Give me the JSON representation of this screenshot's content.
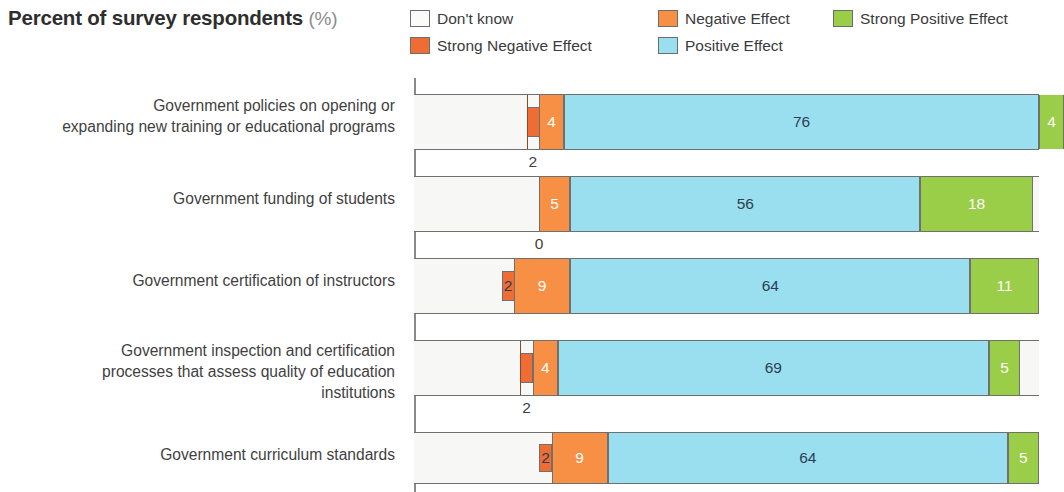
{
  "header": {
    "title": "Percent of survey respondents",
    "unit": "(%)"
  },
  "legend": {
    "items": [
      {
        "label": "Don't know",
        "color": "#fbfbf9",
        "key": "dont_know"
      },
      {
        "label": "Strong Negative Effect",
        "color": "#ef6c35",
        "key": "strong_negative"
      },
      {
        "label": "Negative Effect",
        "color": "#f79044",
        "key": "negative"
      },
      {
        "label": "Positive Effect",
        "color": "#9adff0",
        "key": "positive"
      },
      {
        "label": "Strong Positive Effect",
        "color": "#9acd48",
        "key": "strong_positive"
      }
    ]
  },
  "chart_data": {
    "type": "bar",
    "title": "Percent of survey respondents (%)",
    "xlabel": "",
    "ylabel": "",
    "xlim": [
      0,
      100
    ],
    "grid": false,
    "legend_position": "top-right",
    "stacked": true,
    "orientation": "horizontal",
    "categories": [
      "Government policies on opening or expanding new training or educational programs",
      "Government funding of students",
      "Government certification of instructors",
      "Government inspection and certification processes that assess quality of education institutions",
      "Government curriculum standards"
    ],
    "series": [
      {
        "name": "Don't know",
        "values": [
          18,
          20,
          14,
          17,
          20
        ]
      },
      {
        "name": "Strong Negative Effect",
        "values": [
          2,
          0,
          2,
          2,
          2
        ]
      },
      {
        "name": "Negative Effect",
        "values": [
          4,
          5,
          9,
          4,
          9
        ]
      },
      {
        "name": "Positive Effect",
        "values": [
          76,
          56,
          64,
          69,
          64
        ]
      },
      {
        "name": "Strong Positive Effect",
        "values": [
          4,
          18,
          11,
          5,
          5
        ]
      }
    ]
  },
  "rows": [
    {
      "label_lines": [
        "Government policies on opening or",
        "expanding new training or educational programs"
      ],
      "dont_know": 18,
      "strong_negative": {
        "value": 2,
        "label": "2",
        "placement": "below"
      },
      "negative": {
        "value": 4,
        "label": "4",
        "placement": "inside"
      },
      "positive": {
        "value": 76,
        "label": "76",
        "placement": "inside"
      },
      "strong_positive": {
        "value": 4,
        "label": "4",
        "placement": "inside"
      }
    },
    {
      "label_lines": [
        "Government funding of students"
      ],
      "dont_know": 20,
      "strong_negative": {
        "value": 0,
        "label": "0",
        "placement": "below"
      },
      "negative": {
        "value": 5,
        "label": "5",
        "placement": "inside"
      },
      "positive": {
        "value": 56,
        "label": "56",
        "placement": "inside"
      },
      "strong_positive": {
        "value": 18,
        "label": "18",
        "placement": "inside"
      }
    },
    {
      "label_lines": [
        "Government certification of instructors"
      ],
      "dont_know": 14,
      "strong_negative": {
        "value": 2,
        "label": "2",
        "placement": "inside"
      },
      "negative": {
        "value": 9,
        "label": "9",
        "placement": "inside"
      },
      "positive": {
        "value": 64,
        "label": "64",
        "placement": "inside"
      },
      "strong_positive": {
        "value": 11,
        "label": "11",
        "placement": "inside"
      }
    },
    {
      "label_lines": [
        "Government inspection and certification",
        "processes that assess quality of education",
        "institutions"
      ],
      "dont_know": 17,
      "strong_negative": {
        "value": 2,
        "label": "2",
        "placement": "below"
      },
      "negative": {
        "value": 4,
        "label": "4",
        "placement": "inside"
      },
      "positive": {
        "value": 69,
        "label": "69",
        "placement": "inside"
      },
      "strong_positive": {
        "value": 5,
        "label": "5",
        "placement": "inside"
      }
    },
    {
      "label_lines": [
        "Government curriculum standards"
      ],
      "dont_know": 20,
      "strong_negative": {
        "value": 2,
        "label": "2",
        "placement": "inside"
      },
      "negative": {
        "value": 9,
        "label": "9",
        "placement": "inside"
      },
      "positive": {
        "value": 64,
        "label": "64",
        "placement": "inside"
      },
      "strong_positive": {
        "value": 5,
        "label": "5",
        "placement": "inside"
      }
    }
  ],
  "layout": {
    "track_left": 414,
    "track_width": 625,
    "row_tops": [
      16,
      98,
      180,
      262,
      354
    ],
    "row_heights": [
      56,
      56,
      56,
      56,
      52
    ],
    "label_tops": [
      17,
      110,
      192,
      262,
      366
    ]
  }
}
